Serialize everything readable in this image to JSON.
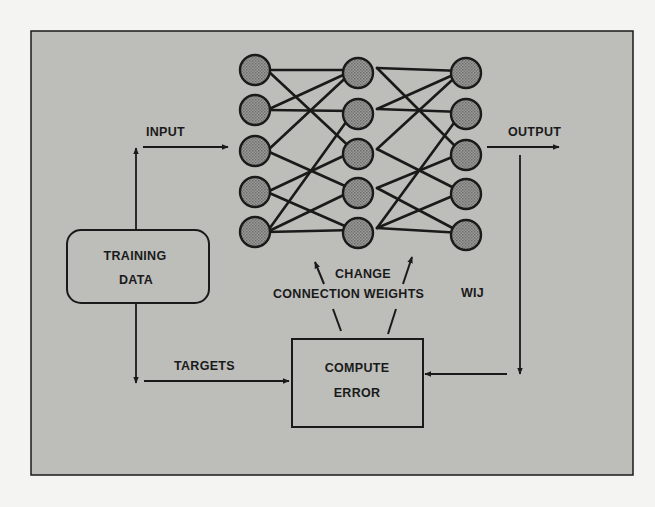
{
  "colors": {
    "page_background": "#f4f4f2",
    "panel_fill": "#bdbdba",
    "stroke": "#1a1a1a",
    "node_fill": "#8e8e8c"
  },
  "labels": {
    "input": "INPUT",
    "output": "OUTPUT",
    "training_data_line1": "TRAINING",
    "training_data_line2": "DATA",
    "targets": "TARGETS",
    "compute_error_line1": "COMPUTE",
    "compute_error_line2": "ERROR",
    "change_line1": "CHANGE",
    "change_line2": "CONNECTION WEIGHTS",
    "weights_symbol": "WIJ"
  },
  "network": {
    "layers": [
      {
        "name": "input-layer",
        "x": 255,
        "nodes_y": [
          70,
          110,
          151,
          192,
          232
        ]
      },
      {
        "name": "hidden-layer",
        "x": 358,
        "nodes_y": [
          73,
          114,
          154,
          193,
          233
        ]
      },
      {
        "name": "output-layer",
        "x": 466,
        "nodes_y": [
          73,
          114,
          155,
          194,
          235
        ]
      }
    ],
    "node_radius": 15,
    "connections_layer1_to_layer2": [
      [
        0,
        0
      ],
      [
        0,
        2
      ],
      [
        1,
        0
      ],
      [
        1,
        1
      ],
      [
        2,
        0
      ],
      [
        2,
        3
      ],
      [
        3,
        2
      ],
      [
        3,
        4
      ],
      [
        4,
        1
      ],
      [
        4,
        3
      ],
      [
        4,
        4
      ]
    ],
    "connections_layer2_to_layer3": [
      [
        0,
        0
      ],
      [
        0,
        2
      ],
      [
        1,
        0
      ],
      [
        1,
        1
      ],
      [
        2,
        0
      ],
      [
        2,
        3
      ],
      [
        3,
        2
      ],
      [
        3,
        4
      ],
      [
        4,
        1
      ],
      [
        4,
        3
      ],
      [
        4,
        4
      ]
    ]
  }
}
